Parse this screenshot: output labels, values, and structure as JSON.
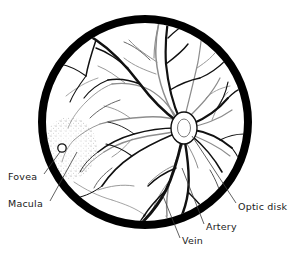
{
  "figure": {
    "background_color": "#ffffff",
    "ink_color": "#1a1a1a"
  },
  "eye": {
    "border": {
      "name": "eyeball-rim",
      "color": "#000000",
      "center_x": 145,
      "center_y": 122,
      "radius": 103,
      "thickness": 8
    },
    "optic_disk": {
      "label": "Optic disk",
      "center_x": 184,
      "center_y": 128,
      "radius_x": 13,
      "radius_y": 16
    },
    "fovea": {
      "label": "Fovea",
      "center_x": 62,
      "center_y": 148,
      "radius": 4
    },
    "macula": {
      "label": "Macula",
      "center_x": 70,
      "center_y": 148,
      "radius_x": 26,
      "radius_y": 30
    }
  },
  "labels": {
    "fovea": "Fovea",
    "macula": "Macula",
    "optic_disk": "Optic disk",
    "artery": "Artery",
    "vein": "Vein"
  },
  "leader_lines": {
    "fovea": "from Fovea text up-right to the fovea marker circle",
    "macula": "from Macula text up-right to the stippled macula region",
    "optic_disk": "from Optic disk text up-left to the optic disk",
    "artery": "from Artery text up-left to a light artery vessel",
    "vein": "from Vein text up-left to a dark vein vessel"
  },
  "vessels": {
    "vein_color": "#111111",
    "artery_color": "#8d8d8d",
    "description": "Branching retinal blood vessels radiating from the optic disk; dark thick branches are veins, pale thin branches are arteries"
  }
}
